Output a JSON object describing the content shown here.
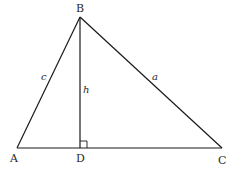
{
  "diagram": {
    "type": "triangle-with-altitude",
    "stroke_color": "#1a1a1a",
    "vertices": {
      "A": {
        "label": "A",
        "x": 17,
        "y": 148
      },
      "B": {
        "label": "B",
        "x": 80,
        "y": 17
      },
      "C": {
        "label": "C",
        "x": 222,
        "y": 148
      },
      "D": {
        "label": "D",
        "x": 80,
        "y": 148
      }
    },
    "sides": {
      "c": {
        "label": "c",
        "from": "A",
        "to": "B"
      },
      "a": {
        "label": "a",
        "from": "B",
        "to": "C"
      },
      "base": {
        "from": "A",
        "to": "C"
      }
    },
    "altitude": {
      "label": "h",
      "from": "B",
      "to": "D",
      "right_angle_marker": true
    }
  }
}
